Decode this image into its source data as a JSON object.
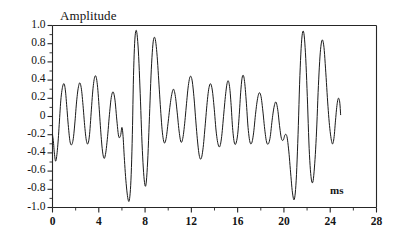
{
  "chart_data": {
    "type": "line",
    "title": "",
    "xlabel": "ms",
    "ylabel": "Amplitude",
    "xlim": [
      0,
      28
    ],
    "ylim": [
      -1.0,
      1.0
    ],
    "grid": false,
    "legend": null,
    "x_ticks": [
      "0",
      "4",
      "8",
      "12",
      "16",
      "20",
      "24",
      "28"
    ],
    "x_tick_values": [
      0,
      4,
      8,
      12,
      16,
      20,
      24,
      28
    ],
    "x_minor_step": 2,
    "y_ticks": [
      "1.0",
      "0.8",
      "0.6",
      "0.4",
      "0.2",
      "0",
      "-0.2",
      "-0.4",
      "-0.6",
      "-0.8",
      "-1.0"
    ],
    "y_tick_values": [
      1.0,
      0.8,
      0.6,
      0.4,
      0.2,
      0,
      -0.2,
      -0.4,
      -0.6,
      -0.8,
      -1.0
    ],
    "y_minor_step": 0.1,
    "line_color": "#1a1a1a",
    "series": [
      {
        "name": "waveform",
        "x": [
          0.0,
          0.08,
          0.16,
          0.26,
          0.36,
          0.48,
          0.6,
          0.72,
          0.86,
          1.0,
          1.12,
          1.24,
          1.38,
          1.52,
          1.66,
          1.8,
          1.94,
          2.08,
          2.22,
          2.36,
          2.5,
          2.64,
          2.78,
          2.92,
          3.06,
          3.2,
          3.34,
          3.48,
          3.62,
          3.76,
          3.9,
          4.04,
          4.18,
          4.32,
          4.46,
          4.6,
          4.76,
          4.92,
          5.08,
          5.24,
          5.4,
          5.56,
          5.72,
          5.88,
          6.0,
          6.1,
          6.2,
          6.34,
          6.5,
          6.64,
          6.78,
          6.9,
          7.0,
          7.12,
          7.26,
          7.42,
          7.58,
          7.74,
          7.9,
          8.06,
          8.22,
          8.38,
          8.54,
          8.7,
          8.86,
          9.02,
          9.18,
          9.34,
          9.5,
          9.66,
          9.82,
          9.98,
          10.14,
          10.3,
          10.46,
          10.62,
          10.78,
          10.94,
          11.1,
          11.26,
          11.42,
          11.58,
          11.74,
          11.9,
          12.06,
          12.22,
          12.38,
          12.54,
          12.7,
          12.86,
          13.02,
          13.18,
          13.34,
          13.5,
          13.66,
          13.82,
          13.98,
          14.14,
          14.3,
          14.46,
          14.62,
          14.78,
          14.94,
          15.08,
          15.2,
          15.32,
          15.44,
          15.56,
          15.7,
          15.84,
          16.0,
          16.14,
          16.26,
          16.38,
          16.5,
          16.62,
          16.76,
          16.9,
          17.06,
          17.22,
          17.38,
          17.54,
          17.7,
          17.86,
          18.02,
          18.18,
          18.34,
          18.5,
          18.66,
          18.82,
          18.98,
          19.14,
          19.3,
          19.46,
          19.62,
          19.78,
          19.94,
          20.1,
          20.26,
          20.42,
          20.58,
          20.74,
          20.9,
          21.06,
          21.22,
          21.38,
          21.54,
          21.7,
          21.86,
          22.02,
          22.18,
          22.34,
          22.5,
          22.66,
          22.82,
          22.98,
          23.14,
          23.3,
          23.46,
          23.62,
          23.78,
          23.94,
          24.1,
          24.22,
          24.34,
          24.46,
          24.58,
          24.7,
          24.82,
          24.9
        ],
        "y": [
          -0.2,
          -0.28,
          -0.4,
          -0.49,
          -0.44,
          -0.28,
          -0.05,
          0.18,
          0.32,
          0.36,
          0.28,
          0.1,
          -0.12,
          -0.28,
          -0.31,
          -0.24,
          -0.06,
          0.16,
          0.31,
          0.37,
          0.3,
          0.12,
          -0.1,
          -0.26,
          -0.3,
          -0.2,
          0.04,
          0.28,
          0.42,
          0.44,
          0.32,
          0.08,
          -0.18,
          -0.38,
          -0.46,
          -0.4,
          -0.22,
          0.02,
          0.21,
          0.27,
          0.18,
          -0.04,
          -0.22,
          -0.21,
          -0.12,
          -0.22,
          -0.44,
          -0.7,
          -0.89,
          -0.92,
          -0.7,
          -0.2,
          0.45,
          0.85,
          0.94,
          0.72,
          0.25,
          -0.3,
          -0.66,
          -0.76,
          -0.5,
          0.0,
          0.52,
          0.82,
          0.86,
          0.7,
          0.4,
          0.08,
          -0.18,
          -0.29,
          -0.24,
          -0.08,
          0.1,
          0.24,
          0.3,
          0.22,
          0.04,
          -0.16,
          -0.28,
          -0.24,
          -0.08,
          0.14,
          0.34,
          0.44,
          0.4,
          0.22,
          -0.04,
          -0.28,
          -0.44,
          -0.46,
          -0.34,
          -0.12,
          0.12,
          0.3,
          0.36,
          0.28,
          0.08,
          -0.16,
          -0.3,
          -0.33,
          -0.22,
          0.0,
          0.22,
          0.36,
          0.39,
          0.31,
          0.12,
          -0.12,
          -0.28,
          -0.3,
          -0.2,
          0.02,
          0.26,
          0.42,
          0.45,
          0.36,
          0.14,
          -0.12,
          -0.28,
          -0.29,
          -0.18,
          0.02,
          0.18,
          0.26,
          0.22,
          0.06,
          -0.14,
          -0.28,
          -0.3,
          -0.22,
          -0.04,
          0.1,
          0.16,
          0.08,
          -0.1,
          -0.24,
          -0.26,
          -0.2,
          -0.22,
          -0.38,
          -0.62,
          -0.84,
          -0.91,
          -0.7,
          -0.2,
          0.45,
          0.85,
          0.93,
          0.7,
          0.22,
          -0.35,
          -0.66,
          -0.72,
          -0.52,
          -0.16,
          0.34,
          0.7,
          0.84,
          0.76,
          0.48,
          0.16,
          -0.1,
          -0.26,
          -0.3,
          -0.22,
          -0.04,
          0.12,
          0.2,
          0.16,
          0.02
        ]
      }
    ],
    "trace_start_x": 0.0,
    "trace_end_x": 24.9,
    "peak_max": 0.96,
    "peak_min": -0.94
  },
  "chart": {
    "y_axis_title": "Amplitude",
    "x_axis_title": "ms"
  }
}
